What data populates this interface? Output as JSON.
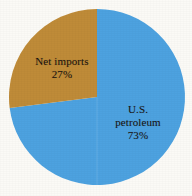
{
  "chart_data": {
    "type": "pie",
    "title": "",
    "subtitle": "",
    "xlabel": "",
    "ylabel": "",
    "legend_position": "none",
    "grid": false,
    "start_angle_deg": 0,
    "direction": "clockwise",
    "categories": [
      "U.S. petroleum",
      "Net imports"
    ],
    "values": [
      73,
      27
    ],
    "value_unit": "%",
    "slices": [
      {
        "name": "us-petroleum",
        "label_lines": [
          "U.S.",
          "petroleum"
        ],
        "value": 73,
        "value_text": "73%",
        "color": "#4da2e0",
        "start_angle_deg": 0,
        "end_angle_deg": 262.8
      },
      {
        "name": "net-imports",
        "label_lines": [
          "Net imports"
        ],
        "value": 27,
        "value_text": "27%",
        "color": "#bf8b38",
        "start_angle_deg": 262.8,
        "end_angle_deg": 360
      }
    ]
  },
  "labels": {
    "net_imports": {
      "line1": "Net imports",
      "line2": "27%"
    },
    "us_petroleum": {
      "line1": "U.S.",
      "line2": "petroleum",
      "line3": "73%"
    }
  },
  "colors": {
    "background": "#fbfaf6",
    "petroleum_blue": "#4da2e0",
    "imports_gold": "#bf8b38",
    "label_text": "#1a1410"
  },
  "geometry": {
    "center_x": 97,
    "center_y": 97,
    "radius": 88
  }
}
